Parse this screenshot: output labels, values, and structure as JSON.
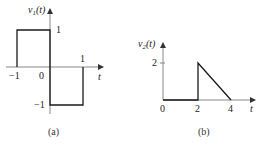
{
  "figures": [
    {
      "id": "a",
      "caption": "(a)",
      "ylabel_main": "v",
      "ylabel_sub": "1",
      "ylabel_arg": "(t)",
      "xlabel": "t",
      "tick_labels": {
        "x_neg1": "−1",
        "x_0": "0",
        "x_1": "1",
        "y_1": "1",
        "y_neg1": "−1"
      },
      "waveform": {
        "description": "Square pulse: 1 for -1<t<0, -1 for 0<t<1, 0 elsewhere",
        "points": [
          [
            -1,
            0
          ],
          [
            -1,
            1
          ],
          [
            0,
            1
          ],
          [
            0,
            -1
          ],
          [
            1,
            -1
          ],
          [
            1,
            0
          ]
        ]
      }
    },
    {
      "id": "b",
      "caption": "(b)",
      "ylabel_main": "v",
      "ylabel_sub": "2",
      "ylabel_arg": "(t)",
      "xlabel": "t",
      "tick_labels": {
        "x_0": "0",
        "x_2": "2",
        "x_4": "4",
        "y_2": "2"
      },
      "waveform": {
        "description": "0 for 0<t<2, jumps to 2 at t=2, ramps linearly down to 0 at t=4",
        "points": [
          [
            0,
            0
          ],
          [
            2,
            0
          ],
          [
            2,
            2
          ],
          [
            4,
            0
          ]
        ]
      }
    }
  ],
  "colors": {
    "axis": "#888888",
    "waveform": "#1a1a1a",
    "text": "#222222"
  }
}
